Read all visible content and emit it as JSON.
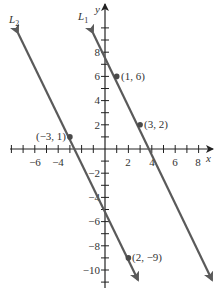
{
  "figure": {
    "axes": {
      "x_label": "x",
      "y_label": "y",
      "x_ticks": [
        -6,
        -4,
        2,
        4,
        6,
        8
      ],
      "x_tick_labels": [
        "−6",
        "−4",
        "2",
        "4",
        "6",
        "8"
      ],
      "y_ticks": [
        8,
        6,
        4,
        2,
        -2,
        -4,
        -6,
        -8,
        -10
      ],
      "y_tick_labels": [
        "8",
        "6",
        "4",
        "2",
        "−2",
        "−4",
        "−6",
        "−8",
        "−10"
      ],
      "x_range": [
        -8,
        9
      ],
      "y_range": [
        -11,
        11
      ]
    },
    "lines": [
      {
        "name": "L1",
        "label_main": "L",
        "label_sub": "1",
        "equation": "y = -2x + 8",
        "color": "#5a5a5a"
      },
      {
        "name": "L2",
        "label_main": "L",
        "label_sub": "2",
        "equation": "y = -2x - 5",
        "color": "#5a5a5a"
      }
    ],
    "points": [
      {
        "x": 1,
        "y": 6,
        "label": "(1, 6)",
        "line": "L1"
      },
      {
        "x": 3,
        "y": 2,
        "label": "(3, 2)",
        "line": "L1"
      },
      {
        "x": -3,
        "y": 1,
        "label": "(−3, 1)",
        "line": "L2"
      },
      {
        "x": 2,
        "y": -9,
        "label": "(2, −9)",
        "line": "L2"
      }
    ]
  }
}
